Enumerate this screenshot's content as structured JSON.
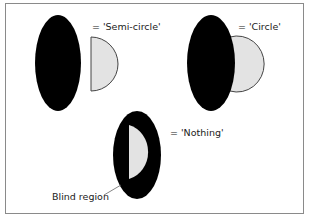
{
  "diagram": {
    "labels": {
      "semi_circle": "= 'Semi-circle'",
      "circle": "= 'Circle'",
      "nothing": "= 'Nothing'",
      "blind_region": "Blind region"
    },
    "colors": {
      "ellipse": "#000000",
      "shape_fill": "#e3e3e3",
      "shape_stroke": "#444444",
      "frame": "#8a8a8a"
    }
  }
}
